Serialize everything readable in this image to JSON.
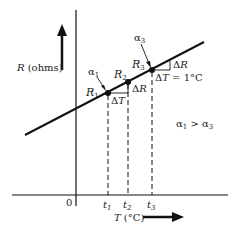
{
  "diagram": {
    "y_axis_label": "R (ohms)",
    "x_axis_label": "T (°C)",
    "origin_label": "0",
    "points": [
      {
        "name": "R",
        "sub": "1",
        "alpha": "α",
        "alpha_sub": "1",
        "t": "t",
        "t_sub": "1"
      },
      {
        "name": "R",
        "sub": "2",
        "t": "t",
        "t_sub": "2"
      },
      {
        "name": "R",
        "sub": "3",
        "alpha": "α",
        "alpha_sub": "3",
        "t": "t",
        "t_sub": "3"
      }
    ],
    "delta_T": "ΔT",
    "delta_R": "ΔR",
    "delta_T_unit": "ΔT = 1°C",
    "comparison": "α₁ > α₃",
    "colors": {
      "line": "#111111",
      "background": "#ffffff"
    }
  }
}
